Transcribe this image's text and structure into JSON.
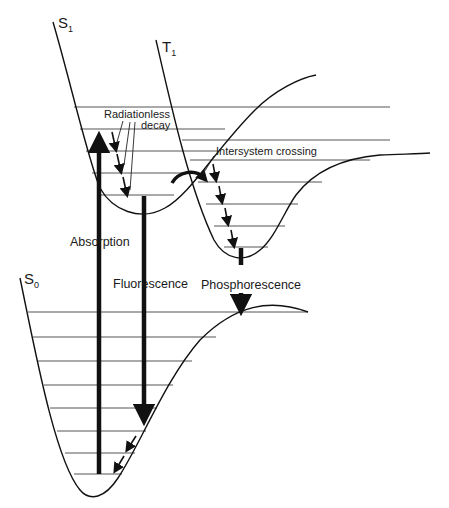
{
  "diagram": {
    "type": "Jablonski / potential energy curve diagram",
    "states": [
      {
        "id": "S1",
        "label": "S",
        "subscript": "1"
      },
      {
        "id": "T1",
        "label": "T",
        "subscript": "1"
      },
      {
        "id": "S0",
        "label": "S",
        "subscript": "0"
      }
    ],
    "processes": [
      {
        "id": "absorption",
        "label": "Absorption"
      },
      {
        "id": "fluorescence",
        "label": "Fluorescence"
      },
      {
        "id": "phosphorescence",
        "label": "Phosphorescence"
      },
      {
        "id": "radiationless_decay",
        "label_line1": "Radiationless",
        "label_line2": "decay"
      },
      {
        "id": "intersystem_crossing",
        "label": "Intersystem crossing"
      }
    ],
    "colors": {
      "background": "#ffffff",
      "ink": "#111111",
      "levels": "#555555"
    }
  }
}
